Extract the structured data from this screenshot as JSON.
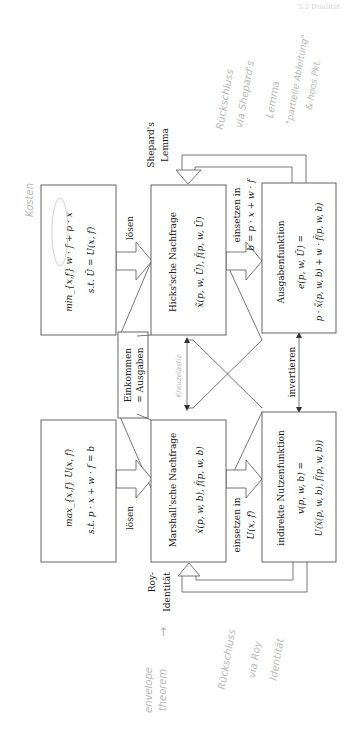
{
  "page": {
    "header_text": "5.5 Dualität",
    "orientation": "rotated-90-ccw"
  },
  "colors": {
    "line": "#555555",
    "text": "#222222",
    "handwriting": "#b8b8b8"
  },
  "boxes": {
    "min_problem": {
      "line1": "min_{x,f} w · f + p · x",
      "line2": "s.t.  Ū = U(x, f)"
    },
    "hicks": {
      "title": "Hicks'sche Nachfrage",
      "formula": "x̃(p, w, Ū), f̃(p, w, Ū)"
    },
    "ausgaben": {
      "title": "Ausgabenfunktion",
      "line1": "e(p, w, Ū) =",
      "line2": "p · x̃(p, w, b) + w · f̃(p, w, b)"
    },
    "max_problem": {
      "line1": "max_{x,f} U(x, f)",
      "line2": "s.t.   p · x + w · f = b"
    },
    "marshall": {
      "title": "Marshall'sche Nachfrage",
      "formula": "x̂(p, w, b), f̂(p, w, b)"
    },
    "indirekt": {
      "title": "indirekte Nutzenfunktion",
      "line1": "v(p, w, b) =",
      "line2": "U(x̂(p, w, b), f̂(p, w, b))"
    },
    "einkommen": {
      "line1": "Einkommen",
      "line2": "= Ausgaben"
    }
  },
  "labels": {
    "loesen_top": "lösen",
    "loesen_bottom": "lösen",
    "einsetzen_top_1": "einsetzen in",
    "einsetzen_top_2": "b = p · x + w · f",
    "einsetzen_bottom_1": "einsetzen in",
    "einsetzen_bottom_2": "U(x, f)",
    "invertieren": "invertieren",
    "shepard_1": "Shepard's",
    "shepard_2": "Lemma",
    "roy_1": "Roy-",
    "roy_2": "Identität"
  },
  "handwriting": {
    "kosten": "Kosten",
    "shepard_note_1": "Rückschluss",
    "shepard_note_2": "via Shepard's",
    "shepard_note_3": "Lemma",
    "shepard_note_4": "\"partielle Ableitung\"",
    "shepard_note_5": "& hoos Pkt.",
    "middle_note": "Kreuzelastiz.",
    "envelope_1": "envelope",
    "envelope_2": "theorem",
    "envelope_arrow": "→",
    "roy_note_1": "Rückschluss",
    "roy_note_2": "via Roy",
    "roy_note_3": "Identität"
  }
}
